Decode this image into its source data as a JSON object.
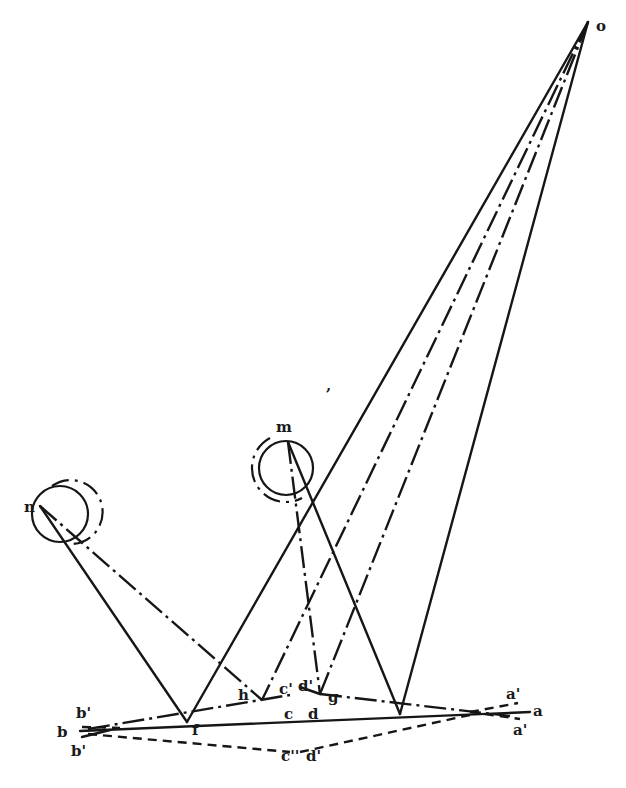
{
  "figure": {
    "type": "geometric optics diagram",
    "colors": {
      "ink": "#161616",
      "background": "#ffffff"
    }
  },
  "labels": {
    "o": "o",
    "m": "m",
    "n": "n",
    "h": "h",
    "c_prime_upper": "c'",
    "d_prime_upper": "d'",
    "g": "g",
    "f": "f",
    "c": "c",
    "d": "d",
    "b": "b",
    "b_upper": "b'",
    "b_lower": "b'",
    "c_lower": "c''",
    "d_lower": "d'",
    "a": "a",
    "a_upper": "a'",
    "a_lower": "a'",
    "stray_mark": ","
  },
  "points": {
    "o": [
      588,
      22
    ],
    "m": [
      288,
      442
    ],
    "n": [
      40,
      506
    ],
    "f": [
      187,
      722
    ],
    "h": [
      262,
      700
    ],
    "g": [
      320,
      694
    ],
    "foot": [
      400,
      714
    ],
    "b": [
      80,
      733
    ],
    "a": [
      530,
      712
    ],
    "convergence_right": [
      470,
      712
    ],
    "convergence_left": [
      110,
      730
    ]
  },
  "legend": {
    "solid": "solid line",
    "dash_dot": "dash-dot line",
    "dashed": "dashed line"
  }
}
